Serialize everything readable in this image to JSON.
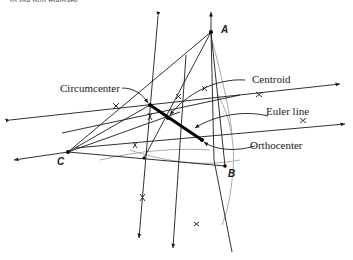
{
  "diagram": {
    "cropped_header_text": "to the two medians",
    "vertices": {
      "A": {
        "label": "A",
        "x": 211,
        "y": 32
      },
      "B": {
        "label": "B",
        "x": 225,
        "y": 166
      },
      "C": {
        "label": "C",
        "x": 68,
        "y": 152
      }
    },
    "centers": {
      "circumcenter": {
        "x": 150,
        "y": 105
      },
      "centroid": {
        "x": 168,
        "y": 118
      },
      "orthocenter": {
        "x": 202,
        "y": 140
      }
    },
    "labels": {
      "circumcenter": "Circumcenter",
      "centroid": "Centroid",
      "euler_line": "Euler line",
      "orthocenter": "Orthocenter"
    },
    "colors": {
      "ink": "#1a1a1a",
      "arc": "#aaaaaa",
      "background": "#ffffff"
    }
  }
}
